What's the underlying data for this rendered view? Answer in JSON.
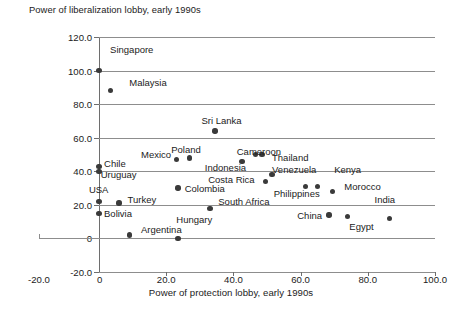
{
  "chart_data": {
    "type": "scatter",
    "title": "",
    "ylabel": "Power of liberalization lobby, early 1990s",
    "xlabel": "Power of protection lobby, early 1990s",
    "xlim": [
      -20.0,
      100.0
    ],
    "ylim": [
      -20.0,
      120.0
    ],
    "xticks": [
      "-20.0",
      "0",
      "20.0",
      "40.0",
      "60.0",
      "80.0",
      "100.0"
    ],
    "xtick_values": [
      -20.0,
      0,
      20.0,
      40.0,
      60.0,
      80.0,
      100.0
    ],
    "yticks": [
      "-20.0",
      "0",
      "20.0",
      "40.0",
      "60.0",
      "80.0",
      "100.0",
      "120.0"
    ],
    "ytick_values": [
      -20.0,
      0,
      20.0,
      40.0,
      60.0,
      80.0,
      100.0,
      120.0
    ],
    "grid": "horizontal",
    "legend": "none",
    "marker_color": "#3a3a3a",
    "points": [
      {
        "label": "Singapore",
        "x": 0.0,
        "y": 100.0
      },
      {
        "label": "Malaysia",
        "x": 3.5,
        "y": 88.0
      },
      {
        "label": "Sri Lanka",
        "x": 34.5,
        "y": 64.0
      },
      {
        "label": "Poland",
        "x": 27.0,
        "y": 48.0
      },
      {
        "label": "Mexico",
        "x": 23.0,
        "y": 47.0
      },
      {
        "label": "Chile",
        "x": 0.0,
        "y": 43.0
      },
      {
        "label": "Uruguay",
        "x": 0.0,
        "y": 40.0
      },
      {
        "label": "Indonesia",
        "x": 42.5,
        "y": 46.0
      },
      {
        "label": "Cameroon",
        "x": 46.5,
        "y": 50.0
      },
      {
        "label": "Thailand",
        "x": 48.5,
        "y": 50.0
      },
      {
        "label": "Venezuela",
        "x": 51.5,
        "y": 38.0
      },
      {
        "label": "Costa Rica",
        "x": 49.5,
        "y": 34.0
      },
      {
        "label": "Kenya",
        "x": 61.5,
        "y": 31.0
      },
      {
        "label": "Philippines",
        "x": 65.0,
        "y": 31.0
      },
      {
        "label": "Morocco",
        "x": 69.5,
        "y": 28.0
      },
      {
        "label": "Colombia",
        "x": 23.5,
        "y": 30.0
      },
      {
        "label": "USA",
        "x": 0.0,
        "y": 22.0
      },
      {
        "label": "Turkey",
        "x": 6.0,
        "y": 21.0
      },
      {
        "label": "South Africa",
        "x": 33.0,
        "y": 18.0
      },
      {
        "label": "China",
        "x": 68.5,
        "y": 14.0
      },
      {
        "label": "Egypt",
        "x": 74.0,
        "y": 13.0
      },
      {
        "label": "India",
        "x": 86.5,
        "y": 12.0
      },
      {
        "label": "Bolivia",
        "x": 0.0,
        "y": 15.0
      },
      {
        "label": "Argentina",
        "x": 9.0,
        "y": 2.0
      },
      {
        "label": "Hungary",
        "x": 23.5,
        "y": 0.0
      }
    ],
    "annotations": [
      {
        "text": "Singapore",
        "x": 3.3,
        "y": 112.0,
        "anchor": "start"
      },
      {
        "text": "Malaysia",
        "x": 9.0,
        "y": 92.5,
        "anchor": "start"
      },
      {
        "text": "Sri Lanka",
        "x": 30.5,
        "y": 70.0,
        "anchor": "start"
      },
      {
        "text": "Poland",
        "x": 21.5,
        "y": 52.5,
        "anchor": "start"
      },
      {
        "text": "Mexico",
        "x": 12.5,
        "y": 50.0,
        "anchor": "start"
      },
      {
        "text": "Cameroon",
        "x": 41.0,
        "y": 51.5,
        "anchor": "start"
      },
      {
        "text": "Thailand",
        "x": 51.5,
        "y": 48.0,
        "anchor": "start"
      },
      {
        "text": "Chile",
        "x": 1.5,
        "y": 44.5,
        "anchor": "start"
      },
      {
        "text": "Indonesia",
        "x": 31.5,
        "y": 42.0,
        "anchor": "start"
      },
      {
        "text": "Venezuela",
        "x": 51.5,
        "y": 41.0,
        "anchor": "start"
      },
      {
        "text": "Kenya",
        "x": 70.0,
        "y": 41.0,
        "anchor": "start"
      },
      {
        "text": "Uruguay",
        "x": 0.5,
        "y": 37.5,
        "anchor": "start"
      },
      {
        "text": "Costa Rica",
        "x": 32.5,
        "y": 35.0,
        "anchor": "start"
      },
      {
        "text": "Morocco",
        "x": 73.0,
        "y": 30.5,
        "anchor": "start"
      },
      {
        "text": "USA",
        "x": -3.0,
        "y": 29.0,
        "anchor": "start"
      },
      {
        "text": "Colombia",
        "x": 25.5,
        "y": 29.5,
        "anchor": "start"
      },
      {
        "text": "Philippines",
        "x": 52.0,
        "y": 26.5,
        "anchor": "start"
      },
      {
        "text": "Turkey",
        "x": 8.5,
        "y": 23.0,
        "anchor": "start"
      },
      {
        "text": "South Africa",
        "x": 35.5,
        "y": 22.0,
        "anchor": "start"
      },
      {
        "text": "India",
        "x": 82.0,
        "y": 23.0,
        "anchor": "start"
      },
      {
        "text": "Bolivia",
        "x": 1.5,
        "y": 14.5,
        "anchor": "start"
      },
      {
        "text": "China",
        "x": 59.0,
        "y": 13.5,
        "anchor": "start"
      },
      {
        "text": "Hungary",
        "x": 23.0,
        "y": 11.0,
        "anchor": "start"
      },
      {
        "text": "Egypt",
        "x": 74.5,
        "y": 7.0,
        "anchor": "start"
      },
      {
        "text": "Argentina",
        "x": 12.5,
        "y": 5.0,
        "anchor": "start"
      }
    ]
  }
}
